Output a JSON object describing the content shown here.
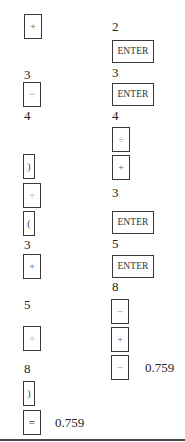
{
  "left_column": {
    "title": "Algebraic entry sequence",
    "steps": [
      {
        "type": "key",
        "label": "+",
        "icon": "plus-key"
      },
      {
        "type": "number",
        "value": "3"
      },
      {
        "type": "key",
        "label": "÷",
        "icon": "divide-key"
      },
      {
        "type": "number",
        "value": "4"
      },
      {
        "type": "key",
        "label": ")",
        "icon": "close-paren-key"
      },
      {
        "type": "key",
        "label": "÷",
        "icon": "divide-key"
      },
      {
        "type": "key",
        "label": "(",
        "icon": "open-paren-key"
      },
      {
        "type": "number",
        "value": "3"
      },
      {
        "type": "key",
        "label": "+",
        "icon": "plus-key"
      },
      {
        "type": "number",
        "value": "5"
      },
      {
        "type": "key",
        "label": "÷",
        "icon": "divide-key"
      },
      {
        "type": "number",
        "value": "8"
      },
      {
        "type": "key",
        "label": ")",
        "icon": "close-paren-key"
      },
      {
        "type": "key",
        "label": "=",
        "icon": "equals-key"
      }
    ],
    "result": "0.759"
  },
  "right_column": {
    "title": "RPN entry sequence",
    "steps": [
      {
        "type": "number",
        "value": "2"
      },
      {
        "type": "key",
        "label": "ENTER"
      },
      {
        "type": "number",
        "value": "3"
      },
      {
        "type": "key",
        "label": "ENTER"
      },
      {
        "type": "number",
        "value": "4"
      },
      {
        "type": "key",
        "label": "÷",
        "icon": "divide-key"
      },
      {
        "type": "key",
        "label": "+",
        "icon": "plus-key"
      },
      {
        "type": "number",
        "value": "3"
      },
      {
        "type": "key",
        "label": "ENTER"
      },
      {
        "type": "number",
        "value": "5"
      },
      {
        "type": "key",
        "label": "ENTER"
      },
      {
        "type": "number",
        "value": "8"
      },
      {
        "type": "key",
        "label": "÷",
        "icon": "divide-key"
      },
      {
        "type": "key",
        "label": "+",
        "icon": "plus-key"
      },
      {
        "type": "key",
        "label": "÷",
        "icon": "divide-key"
      }
    ],
    "result": "0.759"
  }
}
